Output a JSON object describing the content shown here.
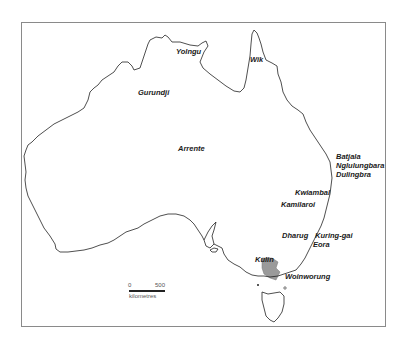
{
  "map": {
    "region": "Australia",
    "labels": [
      {
        "id": "yolngu",
        "text": "Yolngu",
        "x": 176,
        "y": 48
      },
      {
        "id": "wik",
        "text": "Wik",
        "x": 250,
        "y": 56
      },
      {
        "id": "gurundji",
        "text": "Gurundji",
        "x": 138,
        "y": 89
      },
      {
        "id": "arrente",
        "text": "Arrente",
        "x": 178,
        "y": 145
      },
      {
        "id": "batjala",
        "text": "Batjala",
        "x": 336,
        "y": 153
      },
      {
        "id": "nglulungbara",
        "text": "Nglulungbara",
        "x": 336,
        "y": 162
      },
      {
        "id": "dulingbra",
        "text": "Dulingbra",
        "x": 336,
        "y": 171
      },
      {
        "id": "kwiambal",
        "text": "Kwiambal",
        "x": 295,
        "y": 189
      },
      {
        "id": "kamilaroi",
        "text": "Kamilaroi",
        "x": 281,
        "y": 201
      },
      {
        "id": "dharug",
        "text": "Dharug",
        "x": 282,
        "y": 232
      },
      {
        "id": "kuring-gai",
        "text": "Kuring-gai",
        "x": 315,
        "y": 232
      },
      {
        "id": "eora",
        "text": "Eora",
        "x": 313,
        "y": 241
      },
      {
        "id": "kulin",
        "text": "Kulin",
        "x": 255,
        "y": 256
      },
      {
        "id": "woinworung",
        "text": "Woinworung",
        "x": 285,
        "y": 273
      }
    ],
    "highlighted_region": {
      "name": "Kulin",
      "color": "#9a9a9a"
    },
    "scale_bar": {
      "start_label": "0",
      "end_label": "500",
      "unit_label": "kilometres"
    },
    "colors": {
      "coastline": "#222222",
      "frame": "#8a8a8a",
      "background": "#ffffff"
    }
  }
}
